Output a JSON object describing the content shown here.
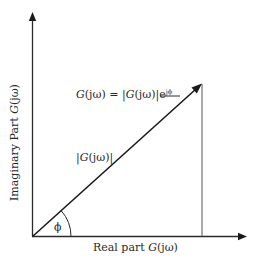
{
  "diagram": {
    "type": "phasor",
    "axes": {
      "x_label": {
        "prefix": "Real part ",
        "func": "G",
        "arg": "(jω)"
      },
      "y_label": {
        "prefix": "Imaginary Part ",
        "func": "G",
        "arg": "(jω)"
      }
    },
    "vector": {
      "equation": {
        "lhs_func": "G",
        "lhs_arg": "(jω)",
        "equals": " = |",
        "rhs_func": "G",
        "rhs_arg": "(jω)",
        "rhs_close": "|e",
        "exponent": "jϕ"
      },
      "magnitude_label": {
        "open": "|",
        "func": "G",
        "arg": "(jω)",
        "close": "|"
      },
      "angle_label": "ϕ"
    },
    "colors": {
      "line": "#2a2a2a",
      "projection": "#555555",
      "background": "#ffffff"
    }
  }
}
